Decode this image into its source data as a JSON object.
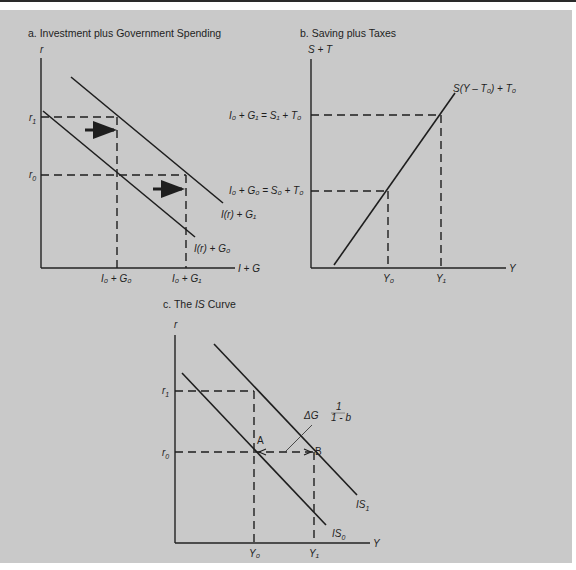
{
  "figure": {
    "panel_a": {
      "title": "a.  Investment plus Government Spending",
      "y_axis": "r",
      "x_axis": "I + G",
      "r1": "r",
      "r1_sub": "1",
      "r0": "r",
      "r0_sub": "0",
      "tick_x0": "I₀ + G₀",
      "tick_x1": "I₀ + G₁",
      "curve_upper": "I(r) + G₁",
      "curve_lower": "I(r) + G₀"
    },
    "panel_b": {
      "title": "b.  Saving plus Taxes",
      "y_axis": "S + T",
      "x_axis": "Y",
      "curve": "S(Y – T₀) + T₀",
      "level_1": "I₀ + G₁ = S₁ + T₀",
      "level_0": "I₀ + G₀ = S₀ + T₀",
      "tick_y0": "Y₀",
      "tick_y1": "Y₁"
    },
    "panel_c": {
      "title_prefix": "c.  The ",
      "title_italic": "IS",
      "title_suffix": " Curve",
      "y_axis": "r",
      "x_axis": "Y",
      "r1": "r",
      "r1_sub": "1",
      "r0": "r",
      "r0_sub": "0",
      "point_a": "A",
      "point_b": "B",
      "multiplier_label": "ΔG",
      "fraction_num": "1",
      "fraction_den": "1 - b",
      "curve_is0": "IS",
      "curve_is0_sub": "0",
      "curve_is1": "IS",
      "curve_is1_sub": "1",
      "tick_y0": "Y₀",
      "tick_y1": "Y₁"
    }
  },
  "colors": {
    "panel_bg": "#c9c9c9",
    "ink": "#1e1e1e",
    "page_bg": "#ffffff"
  }
}
